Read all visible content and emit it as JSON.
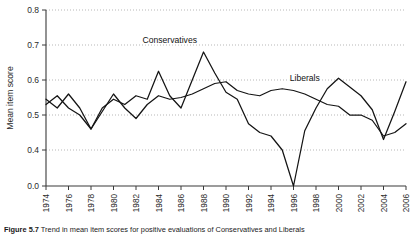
{
  "figure": {
    "caption_prefix": "Figure 5.7",
    "caption_text": "Trend in mean item scores for positive evaluations of Conservatives and Liberals"
  },
  "chart_data": {
    "type": "line",
    "title": "",
    "xlabel": "",
    "ylabel": "Mean item score",
    "ylim": [
      0.0,
      0.8
    ],
    "y_ticks": [
      0.0,
      0.4,
      0.5,
      0.6,
      0.7,
      0.8
    ],
    "y_tick_labels": [
      "0.0",
      "0.4",
      "0.5",
      "0.6",
      "0.7",
      "0.8"
    ],
    "y_axis_break": true,
    "grid": "horizontal-dotted",
    "legend": "inline-annotations",
    "x_ticks": [
      1974,
      1976,
      1978,
      1980,
      1982,
      1984,
      1986,
      1988,
      1990,
      1992,
      1994,
      1996,
      1998,
      2000,
      2002,
      2004,
      2006
    ],
    "x_tick_labels": [
      "1974",
      "1976",
      "1978",
      "1980",
      "1982",
      "1984",
      "1986",
      "1988",
      "1990",
      "1992",
      "1994",
      "1996",
      "1998",
      "2000",
      "2002",
      "2004",
      "2006"
    ],
    "xlim": [
      1974,
      2006
    ],
    "series": [
      {
        "name": "Conservatives",
        "label_x": 1985,
        "label_y": 0.705,
        "x": [
          1974,
          1975,
          1976,
          1977,
          1978,
          1979,
          1980,
          1981,
          1982,
          1983,
          1984,
          1985,
          1986,
          1987,
          1988,
          1989,
          1990,
          1991,
          1992,
          1993,
          1994,
          1995,
          1996,
          1997,
          1998,
          1999,
          2000,
          2001,
          2002,
          2003,
          2004,
          2005,
          2006
        ],
        "y": [
          0.545,
          0.52,
          0.56,
          0.52,
          0.46,
          0.52,
          0.545,
          0.53,
          0.555,
          0.545,
          0.625,
          0.555,
          0.52,
          0.6,
          0.68,
          0.62,
          0.565,
          0.545,
          0.475,
          0.45,
          0.44,
          0.4,
          0.365,
          0.455,
          0.52,
          0.575,
          0.605,
          0.58,
          0.555,
          0.515,
          0.43,
          0.51,
          0.595
        ]
      },
      {
        "name": "Liberals",
        "label_x": 1997,
        "label_y": 0.598,
        "x": [
          1974,
          1975,
          1976,
          1977,
          1978,
          1979,
          1980,
          1981,
          1982,
          1983,
          1984,
          1985,
          1986,
          1987,
          1988,
          1989,
          1990,
          1991,
          1992,
          1993,
          1994,
          1995,
          1996,
          1997,
          1998,
          1999,
          2000,
          2001,
          2002,
          2003,
          2004,
          2005,
          2006
        ],
        "y": [
          0.53,
          0.555,
          0.52,
          0.5,
          0.46,
          0.51,
          0.56,
          0.52,
          0.49,
          0.53,
          0.555,
          0.545,
          0.55,
          0.56,
          0.575,
          0.59,
          0.595,
          0.57,
          0.56,
          0.555,
          0.57,
          0.575,
          0.57,
          0.56,
          0.545,
          0.53,
          0.525,
          0.5,
          0.5,
          0.485,
          0.44,
          0.45,
          0.475
        ]
      }
    ]
  }
}
